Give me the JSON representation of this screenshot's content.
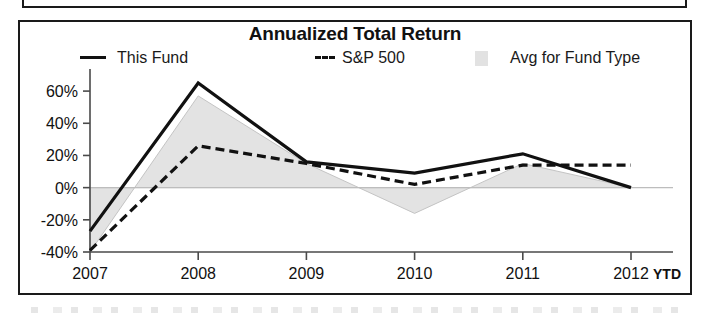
{
  "panel": {
    "title": "Annualized Total Return"
  },
  "legend": {
    "items": [
      {
        "label": "This Fund",
        "marker": "solid-line-swatch"
      },
      {
        "label": "S&P 500",
        "marker": "dashed-line-swatch"
      },
      {
        "label": "Avg for Fund Type",
        "marker": "area-fill-swatch"
      }
    ]
  },
  "axes": {
    "ytd_note": "YTD",
    "y_ticks": [
      "60%",
      "40%",
      "20%",
      "0%",
      "-20%",
      "-40%"
    ],
    "x_ticks": [
      "2007",
      "2008",
      "2009",
      "2010",
      "2011",
      "2012"
    ]
  },
  "colors": {
    "ink": "#111111",
    "axis": "#4a4a4a",
    "area_fill": "#e3e3e3",
    "area_stroke": "#c4c4c4",
    "zero_line": "#bdbdbd",
    "panel_border": "#1a1a1a"
  },
  "chart_data": {
    "type": "line",
    "title": "Annualized Total Return",
    "xlabel": "",
    "ylabel": "",
    "categories": [
      "2007",
      "2008",
      "2009",
      "2010",
      "2011",
      "2012"
    ],
    "x_axis_note": "YTD",
    "ylim": [
      -40,
      70
    ],
    "y_ticks": [
      60,
      40,
      20,
      0,
      -20,
      -40
    ],
    "y_tick_labels": [
      "60%",
      "40%",
      "20%",
      "0%",
      "-20%",
      "-40%"
    ],
    "grid": false,
    "legend_position": "top",
    "series": [
      {
        "name": "This Fund",
        "style": "solid",
        "values": [
          -27,
          65,
          16,
          9,
          21,
          0
        ]
      },
      {
        "name": "S&P 500",
        "style": "dashed",
        "values": [
          -39,
          26,
          15,
          2,
          14,
          14
        ]
      },
      {
        "name": "Avg for Fund Type",
        "style": "area",
        "values": [
          -40,
          57,
          15,
          -16,
          15,
          0
        ]
      }
    ]
  }
}
